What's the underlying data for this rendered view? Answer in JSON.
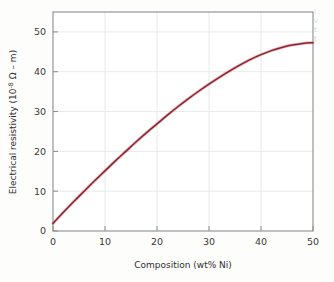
{
  "figure": {
    "background_color": "#fdfdfc",
    "frame_color": "#8a8d8f",
    "grid_color": "#e3e6e8",
    "curve_color": "#8b2331",
    "curve_halo_color": "#c9656b",
    "axis_text_color": "#3a3a3a"
  },
  "axis_titles": {
    "x": "Composition (wt% Ni)",
    "y_prefix": "Electrical resistivity (10",
    "y_exponent": "-8",
    "y_suffix": " Ω – m)"
  },
  "ticks": {
    "x": [
      "0",
      "10",
      "20",
      "30",
      "40",
      "50"
    ],
    "y": [
      "0",
      "10",
      "20",
      "30",
      "40",
      "50"
    ]
  },
  "page_bleed": {
    "lines": [
      "l",
      "v",
      "t",
      "t"
    ]
  },
  "chart_data": {
    "type": "line",
    "title": "",
    "xlabel": "Composition (wt% Ni)",
    "ylabel": "Electrical resistivity (10^-8 Ω - m)",
    "xlim": [
      0,
      50
    ],
    "ylim": [
      0,
      55
    ],
    "xticks": [
      0,
      10,
      20,
      30,
      40,
      50
    ],
    "yticks": [
      0,
      10,
      20,
      30,
      40,
      50
    ],
    "grid": true,
    "legend": false,
    "series": [
      {
        "name": "Electrical resistivity of Cu-Ni alloy",
        "color": "#8b2331",
        "x": [
          0,
          2,
          4,
          6,
          8,
          10,
          12,
          14,
          16,
          18,
          20,
          22,
          24,
          26,
          28,
          30,
          32,
          34,
          36,
          38,
          40,
          42,
          44,
          46,
          48,
          50
        ],
        "y": [
          1.9,
          4.7,
          7.4,
          10.0,
          12.6,
          15.1,
          17.6,
          20.0,
          22.4,
          24.7,
          26.9,
          29.1,
          31.2,
          33.2,
          35.1,
          36.9,
          38.6,
          40.2,
          41.7,
          43.1,
          44.3,
          45.3,
          46.1,
          46.7,
          47.1,
          47.3
        ]
      }
    ]
  }
}
